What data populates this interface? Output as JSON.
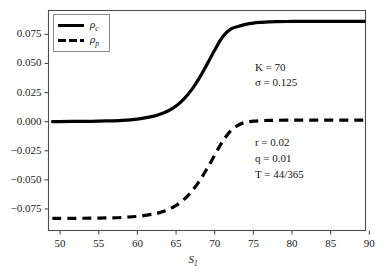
{
  "chart_data": {
    "type": "line",
    "title": "",
    "xlabel": "S",
    "xlabel_sub": "1",
    "ylabel": "",
    "xlim": [
      48.5,
      89.5
    ],
    "ylim": [
      -0.0935,
      0.0955
    ],
    "xticks": [
      50,
      55,
      60,
      65,
      70,
      75,
      80,
      85,
      90
    ],
    "xtick_labels": [
      "50",
      "55",
      "60",
      "65",
      "70",
      "75",
      "80",
      "85",
      "90"
    ],
    "yticks": [
      0.075,
      0.05,
      0.025,
      0.0,
      -0.025,
      -0.05,
      -0.075
    ],
    "ytick_labels": [
      "0.075",
      "0.050",
      "0.025",
      "0.000",
      "−0.025",
      "−0.050",
      "−0.075"
    ],
    "grid": false,
    "legend_position": "upper-left",
    "series": [
      {
        "name": "rho_c",
        "label": "ρ",
        "label_sub": "c",
        "style": "solid",
        "color": "#000000",
        "width": 3.2,
        "lower_plateau": 0.0,
        "upper_plateau": 0.0862,
        "midpoint": 70.0,
        "steepness": 0.255,
        "x": [
          49,
          50,
          52,
          54,
          56,
          58,
          60,
          62,
          63,
          64,
          65,
          66,
          67,
          68,
          69,
          70,
          71,
          72,
          73,
          74,
          75,
          76,
          77,
          78,
          80,
          82,
          84,
          86,
          88,
          89.5
        ],
        "y": [
          0.0001,
          0.0001,
          0.0002,
          0.0003,
          0.0006,
          0.0011,
          0.0022,
          0.0045,
          0.0065,
          0.0094,
          0.0135,
          0.0194,
          0.0273,
          0.0374,
          0.0492,
          0.0615,
          0.0727,
          0.0793,
          0.0818,
          0.0836,
          0.0847,
          0.0853,
          0.0857,
          0.0859,
          0.0861,
          0.0862,
          0.0862,
          0.0862,
          0.0862,
          0.0862
        ]
      },
      {
        "name": "rho_p",
        "label": "ρ",
        "label_sub": "p",
        "style": "dashed",
        "color": "#000000",
        "width": 3.2,
        "lower_plateau": -0.0832,
        "upper_plateau": 0.0013,
        "midpoint": 70.5,
        "steepness": 0.255,
        "x": [
          49,
          50,
          52,
          54,
          56,
          58,
          60,
          62,
          63,
          64,
          65,
          66,
          67,
          68,
          69,
          70,
          71,
          72,
          73,
          74,
          75,
          76,
          77,
          78,
          80,
          82,
          84,
          86,
          88,
          89.5
        ],
        "y": [
          -0.0831,
          -0.0831,
          -0.083,
          -0.0829,
          -0.0827,
          -0.0823,
          -0.0814,
          -0.0795,
          -0.0779,
          -0.0755,
          -0.072,
          -0.067,
          -0.0601,
          -0.0512,
          -0.0404,
          -0.0287,
          -0.0172,
          -0.0084,
          -0.0031,
          -0.0005,
          0.0004,
          0.0009,
          0.0011,
          0.0012,
          0.0013,
          0.0013,
          0.0013,
          0.0013,
          0.0013,
          0.0013
        ]
      }
    ],
    "annotations": [
      {
        "name": "params-top",
        "lines": [
          "K = 70",
          "σ = 0.125"
        ],
        "x": 75.2,
        "y": 0.0465
      },
      {
        "name": "params-bottom",
        "lines": [
          "r = 0.02",
          "q = 0.01",
          "T = 44/365"
        ],
        "x": 75.2,
        "y": -0.0185
      }
    ]
  },
  "legend": {
    "entries": [
      {
        "label": "ρ",
        "sub": "c",
        "style": "solid"
      },
      {
        "label": "ρ",
        "sub": "p",
        "style": "dashed"
      }
    ]
  }
}
